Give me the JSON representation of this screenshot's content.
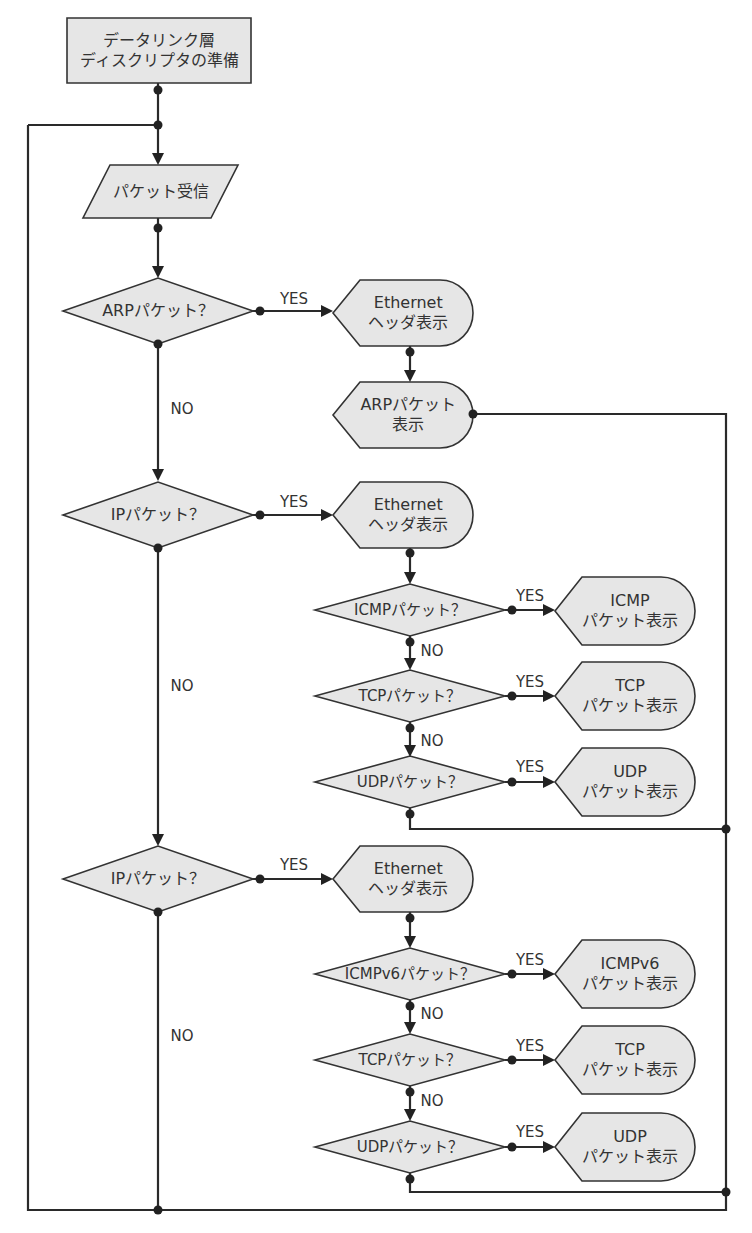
{
  "colors": {
    "node_fill": "#e6e6e6",
    "stroke": "#333333",
    "line": "#2a2a2a",
    "background": "#ffffff"
  },
  "nodes": [
    {
      "id": "prepare",
      "type": "process",
      "label": "データリンク層\nディスクリプタの準備",
      "x": 67,
      "y": 18,
      "w": 184,
      "h": 65
    },
    {
      "id": "receive",
      "type": "io",
      "label": "パケット受信",
      "x": 83,
      "y": 165,
      "w": 155,
      "h": 53,
      "skew": 27
    },
    {
      "id": "is_arp",
      "type": "decision",
      "label": "ARPパケット？",
      "cx": 158,
      "cy": 311,
      "w": 190,
      "h": 66
    },
    {
      "id": "arp_eth",
      "type": "display",
      "label": "Ethernet\nヘッダ表示",
      "x": 333,
      "y": 280,
      "w": 140,
      "h": 66
    },
    {
      "id": "arp_show",
      "type": "display",
      "label": "ARPパケット\n表示",
      "x": 333,
      "y": 382,
      "w": 140,
      "h": 66
    },
    {
      "id": "is_ip",
      "type": "decision",
      "label": "IPパケット？",
      "cx": 158,
      "cy": 515,
      "w": 190,
      "h": 66
    },
    {
      "id": "ip_eth",
      "type": "display",
      "label": "Ethernet\nヘッダ表示",
      "x": 333,
      "y": 482,
      "w": 140,
      "h": 66
    },
    {
      "id": "is_icmp",
      "type": "decision",
      "label": "ICMPパケット？",
      "cx": 410,
      "cy": 610,
      "w": 190,
      "h": 52,
      "small": true
    },
    {
      "id": "icmp_show",
      "type": "display",
      "label": "ICMP\nパケット表示",
      "x": 555,
      "y": 577,
      "w": 140,
      "h": 68
    },
    {
      "id": "is_tcp",
      "type": "decision",
      "label": "TCPパケット？",
      "cx": 410,
      "cy": 696,
      "w": 190,
      "h": 52,
      "small": true
    },
    {
      "id": "tcp_show",
      "type": "display",
      "label": "TCP\nパケット表示",
      "x": 555,
      "y": 662,
      "w": 140,
      "h": 68
    },
    {
      "id": "is_udp",
      "type": "decision",
      "label": "UDPパケット？",
      "cx": 410,
      "cy": 782,
      "w": 190,
      "h": 52,
      "small": true
    },
    {
      "id": "udp_show",
      "type": "display",
      "label": "UDP\nパケット表示",
      "x": 555,
      "y": 748,
      "w": 140,
      "h": 68
    },
    {
      "id": "is_ipv6",
      "type": "decision",
      "label": "IPパケット？",
      "cx": 158,
      "cy": 879,
      "w": 190,
      "h": 66
    },
    {
      "id": "ipv6_eth",
      "type": "display",
      "label": "Ethernet\nヘッダ表示",
      "x": 333,
      "y": 846,
      "w": 140,
      "h": 66
    },
    {
      "id": "is_icmpv6",
      "type": "decision",
      "label": "ICMPv6パケット？",
      "cx": 410,
      "cy": 974,
      "w": 190,
      "h": 52,
      "small": true
    },
    {
      "id": "icmpv6_show",
      "type": "display",
      "label": "ICMPv6\nパケット表示",
      "x": 555,
      "y": 940,
      "w": 140,
      "h": 68
    },
    {
      "id": "is_tcp6",
      "type": "decision",
      "label": "TCPパケット？",
      "cx": 410,
      "cy": 1060,
      "w": 190,
      "h": 52,
      "small": true
    },
    {
      "id": "tcp6_show",
      "type": "display",
      "label": "TCP\nパケット表示",
      "x": 555,
      "y": 1026,
      "w": 140,
      "h": 68
    },
    {
      "id": "is_udp6",
      "type": "decision",
      "label": "UDPパケット？",
      "cx": 410,
      "cy": 1147,
      "w": 190,
      "h": 52,
      "small": true
    },
    {
      "id": "udp6_show",
      "type": "display",
      "label": "UDP\nパケット表示",
      "x": 555,
      "y": 1113,
      "w": 140,
      "h": 68
    }
  ],
  "edge_labels": [
    {
      "text": "YES",
      "x": 294,
      "y": 299
    },
    {
      "text": "NO",
      "x": 182,
      "y": 409
    },
    {
      "text": "YES",
      "x": 294,
      "y": 502
    },
    {
      "text": "NO",
      "x": 182,
      "y": 686
    },
    {
      "text": "YES",
      "x": 530,
      "y": 596
    },
    {
      "text": "NO",
      "x": 432,
      "y": 651
    },
    {
      "text": "YES",
      "x": 530,
      "y": 682
    },
    {
      "text": "NO",
      "x": 432,
      "y": 741
    },
    {
      "text": "YES",
      "x": 530,
      "y": 767
    },
    {
      "text": "YES",
      "x": 294,
      "y": 865
    },
    {
      "text": "NO",
      "x": 182,
      "y": 1036
    },
    {
      "text": "YES",
      "x": 530,
      "y": 960
    },
    {
      "text": "NO",
      "x": 432,
      "y": 1014
    },
    {
      "text": "YES",
      "x": 530,
      "y": 1046
    },
    {
      "text": "NO",
      "x": 432,
      "y": 1101
    },
    {
      "text": "YES",
      "x": 530,
      "y": 1132
    }
  ],
  "lines": [
    [
      [
        158,
        83
      ],
      [
        158,
        162
      ]
    ],
    [
      [
        28,
        125
      ],
      [
        158,
        125
      ]
    ],
    [
      [
        28,
        125
      ],
      [
        28,
        1210
      ],
      [
        726,
        1210
      ],
      [
        726,
        414
      ],
      [
        473,
        414
      ]
    ],
    [
      [
        158,
        218
      ],
      [
        158,
        275
      ]
    ],
    [
      [
        158,
        344
      ],
      [
        158,
        478
      ]
    ],
    [
      [
        158,
        548
      ],
      [
        158,
        843
      ]
    ],
    [
      [
        158,
        912
      ],
      [
        158,
        1210
      ]
    ],
    [
      [
        410,
        346
      ],
      [
        410,
        379
      ]
    ],
    [
      [
        410,
        548
      ],
      [
        410,
        581
      ]
    ],
    [
      [
        410,
        636
      ],
      [
        410,
        667
      ]
    ],
    [
      [
        410,
        722
      ],
      [
        410,
        753
      ]
    ],
    [
      [
        410,
        808
      ],
      [
        410,
        829
      ],
      [
        726,
        829
      ]
    ],
    [
      [
        410,
        912
      ],
      [
        410,
        945
      ]
    ],
    [
      [
        410,
        1000
      ],
      [
        410,
        1031
      ]
    ],
    [
      [
        410,
        1086
      ],
      [
        410,
        1118
      ]
    ],
    [
      [
        410,
        1173
      ],
      [
        410,
        1192
      ],
      [
        726,
        1192
      ]
    ],
    [
      [
        253,
        311
      ],
      [
        330,
        311
      ]
    ],
    [
      [
        253,
        515
      ],
      [
        330,
        515
      ]
    ],
    [
      [
        253,
        879
      ],
      [
        330,
        879
      ]
    ],
    [
      [
        505,
        610
      ],
      [
        552,
        610
      ]
    ],
    [
      [
        505,
        696
      ],
      [
        552,
        696
      ]
    ],
    [
      [
        505,
        782
      ],
      [
        552,
        782
      ]
    ],
    [
      [
        505,
        974
      ],
      [
        552,
        974
      ]
    ],
    [
      [
        505,
        1060
      ],
      [
        552,
        1060
      ]
    ],
    [
      [
        505,
        1147
      ],
      [
        552,
        1147
      ]
    ]
  ],
  "arrows": [
    {
      "x": 158,
      "y": 165,
      "dir": "down"
    },
    {
      "x": 158,
      "y": 278,
      "dir": "down"
    },
    {
      "x": 158,
      "y": 481,
      "dir": "down"
    },
    {
      "x": 158,
      "y": 846,
      "dir": "down"
    },
    {
      "x": 410,
      "y": 382,
      "dir": "down"
    },
    {
      "x": 410,
      "y": 584,
      "dir": "down"
    },
    {
      "x": 410,
      "y": 670,
      "dir": "down"
    },
    {
      "x": 410,
      "y": 757,
      "dir": "down"
    },
    {
      "x": 410,
      "y": 948,
      "dir": "down"
    },
    {
      "x": 410,
      "y": 1034,
      "dir": "down"
    },
    {
      "x": 410,
      "y": 1121,
      "dir": "down"
    },
    {
      "x": 333,
      "y": 311,
      "dir": "right"
    },
    {
      "x": 333,
      "y": 515,
      "dir": "right"
    },
    {
      "x": 333,
      "y": 879,
      "dir": "right"
    },
    {
      "x": 555,
      "y": 610,
      "dir": "right"
    },
    {
      "x": 555,
      "y": 696,
      "dir": "right"
    },
    {
      "x": 555,
      "y": 782,
      "dir": "right"
    },
    {
      "x": 555,
      "y": 974,
      "dir": "right"
    },
    {
      "x": 555,
      "y": 1060,
      "dir": "right"
    },
    {
      "x": 555,
      "y": 1147,
      "dir": "right"
    }
  ],
  "dots": [
    [
      158,
      90
    ],
    [
      158,
      125
    ],
    [
      158,
      228
    ],
    [
      158,
      344
    ],
    [
      260,
      311
    ],
    [
      158,
      548
    ],
    [
      260,
      515
    ],
    [
      410,
      352
    ],
    [
      473,
      414
    ],
    [
      410,
      553
    ],
    [
      410,
      642
    ],
    [
      512,
      610
    ],
    [
      410,
      728
    ],
    [
      512,
      696
    ],
    [
      410,
      814
    ],
    [
      512,
      782
    ],
    [
      726,
      829
    ],
    [
      158,
      912
    ],
    [
      260,
      879
    ],
    [
      410,
      918
    ],
    [
      410,
      1006
    ],
    [
      512,
      974
    ],
    [
      410,
      1092
    ],
    [
      512,
      1060
    ],
    [
      410,
      1179
    ],
    [
      512,
      1147
    ],
    [
      726,
      1192
    ],
    [
      158,
      1210
    ]
  ]
}
